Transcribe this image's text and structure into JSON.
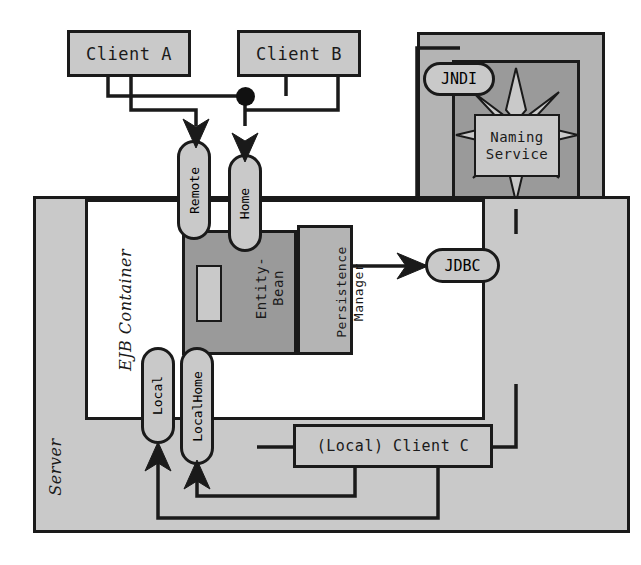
{
  "diagram": {
    "colors": {
      "light_gray": "#c9c9c9",
      "mid_gray": "#b4b4b4",
      "dark_gray": "#9a9a9a",
      "white": "#ffffff",
      "stroke": "#1a1a1a"
    },
    "clients": {
      "client_a": "Client A",
      "client_b": "Client B",
      "client_c": "(Local) Client C"
    },
    "containers": {
      "server": "Server",
      "ejb_container": "EJB Container"
    },
    "bean": {
      "entity_bean": "Entity-\nBean",
      "persistence_manager": "Persistence\nManager"
    },
    "interfaces": {
      "remote": "Remote",
      "home": "Home",
      "local": "Local",
      "local_home": "LocalHome"
    },
    "services": {
      "jndi": "JNDI",
      "naming_service": "Naming\nService",
      "jdbc": "JDBC",
      "db": "DB"
    },
    "icons": {
      "junction": "junction-dot",
      "star": "star-burst",
      "cylinder": "database-cylinder",
      "arrow": "arrow-head"
    }
  }
}
